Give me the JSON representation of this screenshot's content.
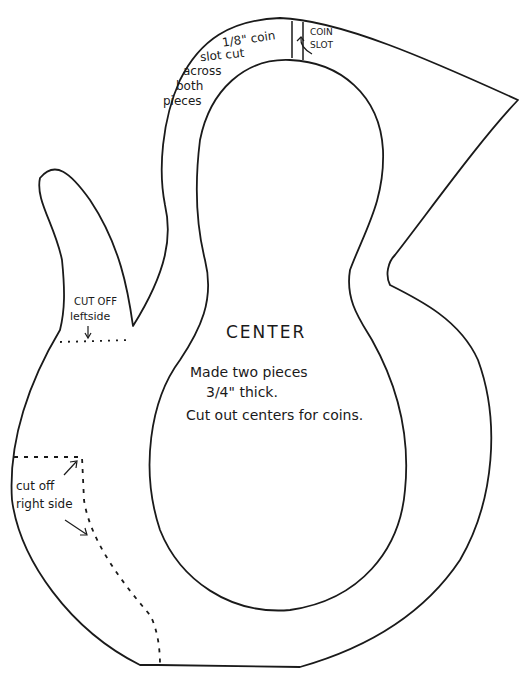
{
  "diagram": {
    "title": "CENTER",
    "instructions": {
      "line1": "Made two pieces",
      "line2": "3/4\" thick.",
      "line3": "Cut out centers for coins."
    },
    "annotations": {
      "coin_slot_note": {
        "line1": "1/8\" coin",
        "line2": "slot cut",
        "line3": "across",
        "line4": "both",
        "line5": "pieces"
      },
      "coin_slot_label": {
        "line1": "COIN",
        "line2": "SLOT"
      },
      "cut_left": {
        "line1": "CUT OFF",
        "line2": "leftside"
      },
      "cut_right": {
        "line1": "cut off",
        "line2": "right side"
      }
    },
    "colors": {
      "line": "#1a1a1a",
      "background": "#ffffff"
    }
  }
}
